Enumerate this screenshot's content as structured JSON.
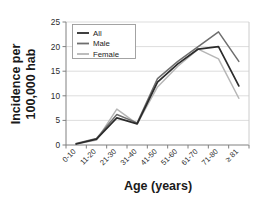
{
  "chart_data": {
    "type": "line",
    "title": "",
    "xlabel": "Age (years)",
    "ylabel": "Incidence per 100,000 hab",
    "ylabel_lines": [
      "Incidence per",
      "100,000 hab"
    ],
    "categories": [
      "0-10",
      "11-20",
      "21-30",
      "31-40",
      "41-50",
      "51-60",
      "61-70",
      "71-80",
      "≥ 81"
    ],
    "ylim": [
      0,
      25
    ],
    "yticks": [
      0,
      5,
      10,
      15,
      20,
      25
    ],
    "ytick_labels": [
      "0",
      "5",
      "10",
      "15",
      "20",
      "25"
    ],
    "grid": true,
    "grid_axis": "y",
    "legend_position": "upper-left-inside",
    "series": [
      {
        "name": "All",
        "color": "#2b2b2b",
        "values": [
          0.2,
          1.2,
          5.5,
          4.3,
          12.8,
          16.5,
          19.5,
          20.0,
          12.0
        ]
      },
      {
        "name": "Male",
        "color": "#6e6e6e",
        "values": [
          0.3,
          1.3,
          6.2,
          4.5,
          13.5,
          17.0,
          20.0,
          23.0,
          17.0
        ]
      },
      {
        "name": "Female",
        "color": "#b6b6b6",
        "values": [
          0.2,
          1.0,
          7.3,
          4.3,
          11.8,
          16.0,
          19.5,
          17.5,
          9.5
        ]
      }
    ]
  },
  "legend": {
    "entries": [
      {
        "label": "All"
      },
      {
        "label": "Male"
      },
      {
        "label": "Female"
      }
    ]
  },
  "colors": {
    "background": "#ffffff",
    "axis": "#808080",
    "grid": "#d9d9d9",
    "text": "#1a1a1a",
    "all": "#2b2b2b",
    "male": "#6e6e6e",
    "female": "#b6b6b6"
  }
}
